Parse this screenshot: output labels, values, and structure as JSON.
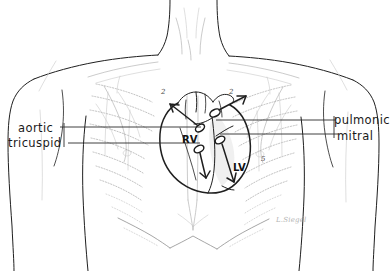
{
  "figure": {
    "type": "anatomical-illustration",
    "style": "hand-drawn pencil line art",
    "background_color": "#ffffff",
    "ink_color": "#1a1a1a",
    "faint_ink_color": "#b9b9b9"
  },
  "labels": {
    "aortic": "aortic",
    "tricuspid": "tricuspid",
    "pulmonic": "pulmonic",
    "mitral": "mitral"
  },
  "chambers": {
    "right_ventricle": "RV",
    "left_ventricle": "LV"
  },
  "rib_markers": {
    "left_second": "2",
    "right_second": "2",
    "right_fifth": "5"
  },
  "signature": "L.Siegel",
  "leader_lines": [
    {
      "name": "pulmonic",
      "side": "right",
      "y": 120
    },
    {
      "name": "aortic",
      "side": "left",
      "y": 127
    },
    {
      "name": "mitral",
      "side": "right",
      "y": 134
    },
    {
      "name": "tricuspid",
      "side": "left",
      "y": 143
    }
  ],
  "valve_points": [
    {
      "name": "pulmonic",
      "x": 215,
      "y": 113
    },
    {
      "name": "aortic",
      "x": 200,
      "y": 127
    },
    {
      "name": "mitral",
      "x": 219,
      "y": 139
    },
    {
      "name": "tricuspid",
      "x": 199,
      "y": 148
    }
  ]
}
